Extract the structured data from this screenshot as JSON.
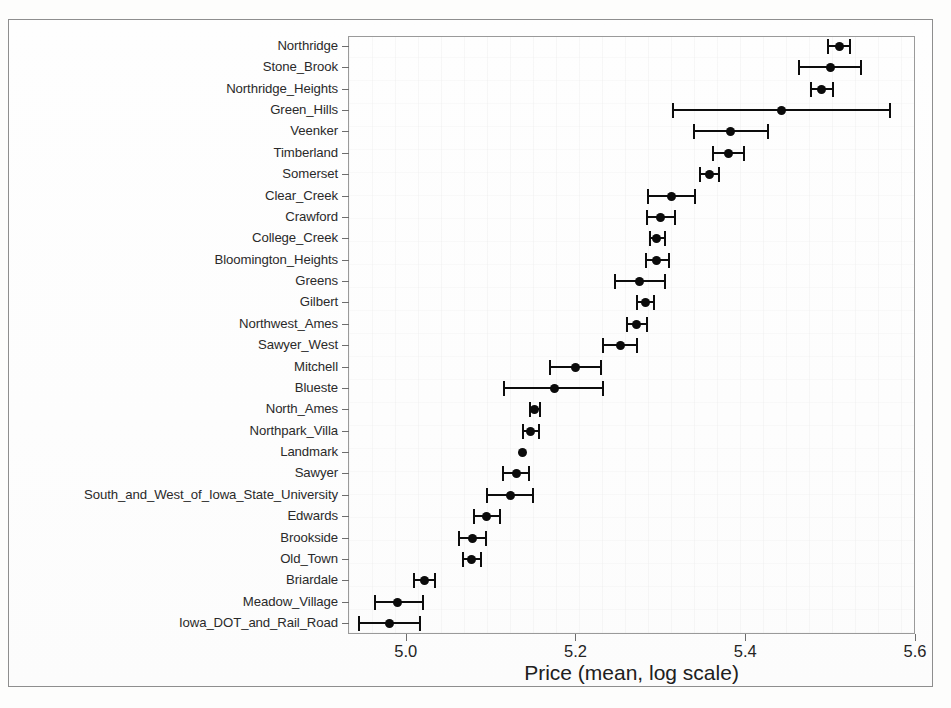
{
  "figure": {
    "xaxis_title": "Price (mean, log scale)",
    "x_tick_labels": [
      "5.0",
      "5.2",
      "5.4",
      "5.6"
    ]
  },
  "chart_data": {
    "type": "scatter",
    "subtype": "dot-and-whisker (mean with confidence interval)",
    "orientation": "horizontal",
    "title": "",
    "xlabel": "Price (mean, log scale)",
    "ylabel": "",
    "xlim": [
      4.932,
      5.6
    ],
    "xticks": [
      5.0,
      5.2,
      5.4,
      5.6
    ],
    "grid": false,
    "legend": "none",
    "categories": [
      "Northridge",
      "Stone_Brook",
      "Northridge_Heights",
      "Green_Hills",
      "Veenker",
      "Timberland",
      "Somerset",
      "Clear_Creek",
      "Crawford",
      "College_Creek",
      "Bloomington_Heights",
      "Greens",
      "Gilbert",
      "Northwest_Ames",
      "Sawyer_West",
      "Mitchell",
      "Blueste",
      "North_Ames",
      "Northpark_Villa",
      "Landmark",
      "Sawyer",
      "South_and_West_of_Iowa_State_University",
      "Edwards",
      "Brookside",
      "Old_Town",
      "Briardale",
      "Meadow_Village",
      "Iowa_DOT_and_Rail_Road"
    ],
    "values": [
      5.511,
      5.5,
      5.49,
      5.443,
      5.383,
      5.38,
      5.358,
      5.313,
      5.3,
      5.296,
      5.295,
      5.276,
      5.282,
      5.272,
      5.253,
      5.2,
      5.175,
      5.152,
      5.147,
      5.138,
      5.13,
      5.123,
      5.095,
      5.079,
      5.078,
      5.022,
      4.99,
      4.981
    ],
    "ci_low": [
      5.498,
      5.463,
      5.478,
      5.315,
      5.34,
      5.362,
      5.347,
      5.286,
      5.284,
      5.288,
      5.283,
      5.247,
      5.272,
      5.261,
      5.232,
      5.17,
      5.116,
      5.147,
      5.138,
      5.138,
      5.115,
      5.096,
      5.08,
      5.063,
      5.068,
      5.01,
      4.964,
      4.945
    ],
    "ci_high": [
      5.524,
      5.536,
      5.503,
      5.571,
      5.427,
      5.399,
      5.369,
      5.341,
      5.317,
      5.305,
      5.31,
      5.305,
      5.292,
      5.284,
      5.273,
      5.23,
      5.233,
      5.158,
      5.157,
      5.138,
      5.145,
      5.15,
      5.111,
      5.095,
      5.089,
      5.034,
      5.02,
      5.017
    ]
  }
}
